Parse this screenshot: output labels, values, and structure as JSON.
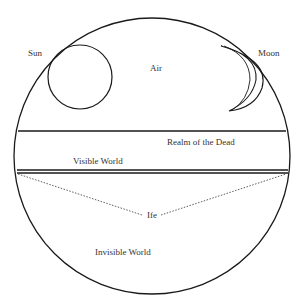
{
  "diagram": {
    "labels": {
      "sun": "Sun",
      "moon": "Moon",
      "air": "Air",
      "realm_of_the_dead": "Realm of the Dead",
      "visible_world": "Visible World",
      "ife": "Ife",
      "invisible_world": "Invisible World"
    },
    "colors": {
      "stroke": "#1a1a1a",
      "text": "#333333",
      "background": "#ffffff"
    }
  }
}
